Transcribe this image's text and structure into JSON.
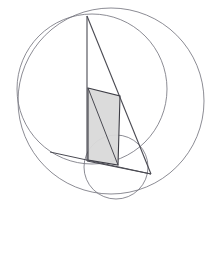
{
  "canvas": {
    "width": 216,
    "height": 257,
    "background": "#ffffff",
    "title": "geometric-construction-figure"
  },
  "style": {
    "stroke_color": "#4a4a52",
    "stroke_color_light": "#6e6e78",
    "stroke_width_circle": 0.8,
    "stroke_width_line": 1.1,
    "shaded_fill": "#d9d9d9",
    "shaded_fill_opacity": 0.95,
    "shaded_stroke": "#3c3c44"
  },
  "circles": [
    {
      "name": "large-circle-right",
      "cx": 111,
      "cy": 101,
      "r": 93,
      "fill": "none"
    },
    {
      "name": "large-circle-left",
      "cx": 92,
      "cy": 89,
      "r": 75,
      "fill": "none"
    },
    {
      "name": "small-circle-bottom",
      "cx": 116,
      "cy": 167,
      "r": 32,
      "fill": "none"
    }
  ],
  "points": [
    {
      "name": "apex",
      "x": 87,
      "y": 16
    },
    {
      "name": "quad-top-left",
      "x": 88,
      "y": 88
    },
    {
      "name": "quad-top-right",
      "x": 120,
      "y": 96
    },
    {
      "name": "quad-bottom-right",
      "x": 118,
      "y": 165
    },
    {
      "name": "quad-bottom-left",
      "x": 88,
      "y": 160
    },
    {
      "name": "base-left",
      "x": 87,
      "y": 161
    },
    {
      "name": "base-right",
      "x": 151,
      "y": 174
    },
    {
      "name": "chord-left-end",
      "x": 50,
      "y": 152
    }
  ],
  "segments": [
    {
      "name": "left-vertical-edge",
      "x1": 87,
      "y1": 16,
      "x2": 87,
      "y2": 161
    },
    {
      "name": "apex-to-base-right",
      "x1": 87,
      "y1": 16,
      "x2": 151,
      "y2": 174
    },
    {
      "name": "base-edge",
      "x1": 87,
      "y1": 161,
      "x2": 151,
      "y2": 174
    },
    {
      "name": "quad-top-edge",
      "x1": 88,
      "y1": 88,
      "x2": 120,
      "y2": 96
    },
    {
      "name": "quad-right-edge",
      "x1": 120,
      "y1": 96,
      "x2": 118,
      "y2": 165
    },
    {
      "name": "quad-diagonal-cross",
      "x1": 88,
      "y1": 88,
      "x2": 118,
      "y2": 165
    },
    {
      "name": "long-chord-left",
      "x1": 50,
      "y1": 152,
      "x2": 151,
      "y2": 174
    }
  ],
  "shaded_region": {
    "name": "shaded-quadrilateral",
    "points": "88,88 120,96 118,165 88,160"
  }
}
